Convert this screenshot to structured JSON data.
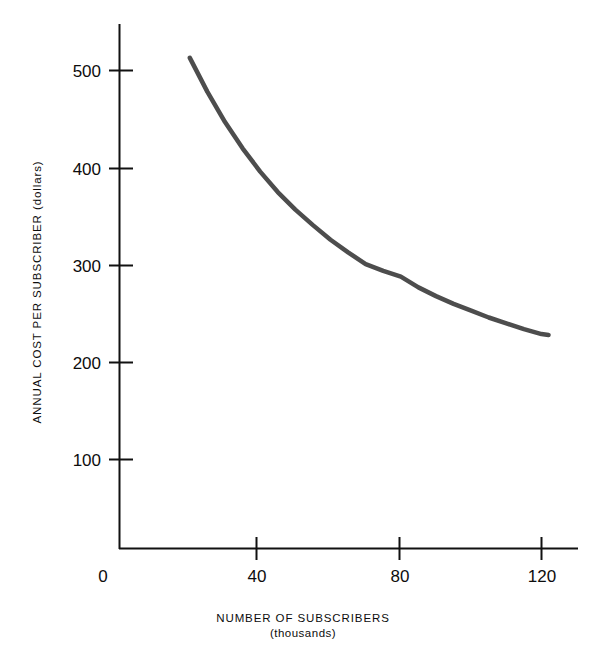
{
  "chart_data": {
    "type": "line",
    "title": "",
    "xlabel": "NUMBER OF SUBSCRIBERS",
    "xlabel_sub": "(thousands)",
    "ylabel": "ANNUAL COST PER SUBSCRIBER (dollars)",
    "xlim": [
      0,
      130
    ],
    "ylim": [
      0,
      530
    ],
    "grid": false,
    "legend": "none",
    "x_ticks": [
      {
        "value": 0,
        "label": "0"
      },
      {
        "value": 40,
        "label": "40"
      },
      {
        "value": 80,
        "label": "80"
      },
      {
        "value": 120,
        "label": "120"
      }
    ],
    "y_ticks": [
      {
        "value": 100,
        "label": "100"
      },
      {
        "value": 200,
        "label": "200"
      },
      {
        "value": 300,
        "label": "300"
      },
      {
        "value": 400,
        "label": "400"
      },
      {
        "value": 500,
        "label": "500"
      }
    ],
    "series": [
      {
        "name": "Annual cost per subscriber",
        "color": "#4d4d4d",
        "line_width": 4.5,
        "x": [
          20,
          25,
          30,
          35,
          40,
          45,
          50,
          55,
          60,
          65,
          70,
          75,
          80,
          85,
          90,
          95,
          100,
          105,
          110,
          115,
          120,
          122
        ],
        "y": [
          513,
          478,
          447,
          420,
          396,
          375,
          357,
          341,
          326,
          313,
          301,
          294,
          288,
          277,
          268,
          260,
          253,
          246,
          240,
          234,
          229,
          228
        ]
      }
    ]
  }
}
